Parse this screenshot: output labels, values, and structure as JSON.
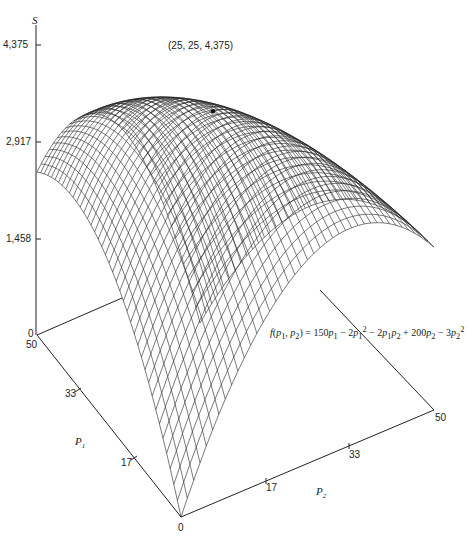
{
  "chart_data": {
    "type": "surface3d",
    "title": "",
    "function": "f(p1, p2) = 150p1 - 2p1^2 - 2p1p2 + 200p2 - 3p2^2",
    "equation_label": {
      "lhs": "f(p1, p2) =",
      "rhs": "150p1 − 2p1² − 2p1p2 + 200p2 − 3p2²"
    },
    "x_axis": {
      "label": "P1",
      "range": [
        0,
        50
      ],
      "ticks": [
        "0",
        "17",
        "33",
        "50"
      ]
    },
    "y_axis": {
      "label": "P2",
      "range": [
        0,
        50
      ],
      "ticks": [
        "0",
        "17",
        "33",
        "50"
      ]
    },
    "z_axis": {
      "label": "S",
      "range": [
        0,
        4375
      ],
      "ticks": [
        "0",
        "1,458",
        "2,917",
        "4,375"
      ]
    },
    "annotation": {
      "point": [
        25,
        25,
        4375
      ],
      "text": "(25, 25, 4,375)"
    },
    "grid_lines": 40,
    "grid": false,
    "legend": "none"
  },
  "labels": {
    "z_title": "S",
    "z_ticks": [
      "4,375",
      "2,917",
      "1,458",
      "0"
    ],
    "p1_title": "P",
    "p1_sub": "1",
    "p1_ticks": [
      "50",
      "33",
      "17"
    ],
    "p2_title": "P",
    "p2_sub": "2",
    "p2_ticks": [
      "17",
      "33",
      "50"
    ],
    "origin": "0",
    "peak": "(25, 25, 4,375)"
  }
}
